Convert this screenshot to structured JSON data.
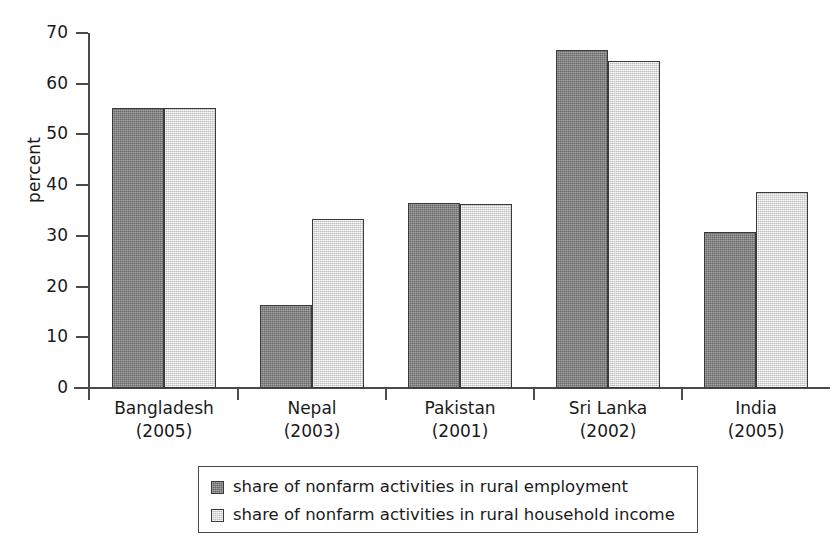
{
  "chart_data": {
    "type": "bar",
    "title": "",
    "xlabel": "",
    "ylabel": "percent",
    "ylim": [
      0,
      70
    ],
    "yticks": [
      0,
      10,
      20,
      30,
      40,
      50,
      60,
      70
    ],
    "ytick_labels": [
      "0",
      "10",
      "20",
      "30",
      "40",
      "50",
      "60",
      "70"
    ],
    "grid": false,
    "legend_position": "bottom",
    "categories": [
      "Bangladesh",
      "Nepal",
      "Pakistan",
      "Sri Lanka",
      "India"
    ],
    "category_years": [
      "(2005)",
      "(2003)",
      "(2001)",
      "(2002)",
      "(2005)"
    ],
    "series": [
      {
        "name": "share of nonfarm activities in rural employment",
        "color": "#808080",
        "values": [
          55.2,
          16.3,
          36.4,
          66.6,
          30.7
        ]
      },
      {
        "name": "share of nonfarm activities in rural household income",
        "color": "#d9d9d9",
        "values": [
          55.2,
          33.3,
          36.3,
          64.5,
          38.7
        ]
      }
    ]
  },
  "axis": {
    "y_label": "percent"
  },
  "legend": {
    "items": [
      {
        "label": "share of nonfarm activities in rural employment",
        "swatch": "dark-gray-swatch"
      },
      {
        "label": "share of nonfarm activities in rural household income",
        "swatch": "light-gray-swatch"
      }
    ]
  }
}
